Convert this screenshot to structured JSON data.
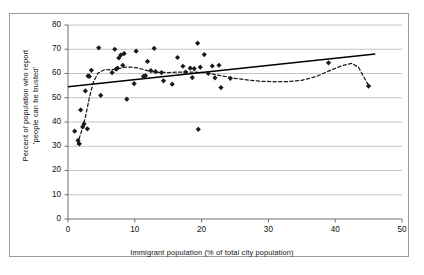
{
  "chart_data": {
    "type": "scatter",
    "title": "",
    "xlabel": "Immigrant population  (% of total city population)",
    "ylabel": "Percent of population who report 'people can be trusted'",
    "ylabel_line1": "Percent of population who report",
    "ylabel_line2": "'people can be trusted'",
    "xlim": [
      0,
      50
    ],
    "ylim": [
      0,
      80
    ],
    "xticks": [
      0,
      10,
      20,
      30,
      40,
      50
    ],
    "yticks": [
      0,
      10,
      20,
      30,
      40,
      50,
      60,
      70,
      80
    ],
    "xtick_labels": [
      "0",
      "10",
      "20",
      "30",
      "40",
      "50"
    ],
    "ytick_labels": [
      "0",
      "10",
      "20",
      "30",
      "40",
      "50",
      "60",
      "70",
      "80"
    ],
    "grid": "horizontal",
    "legend": "none",
    "marker": "diamond",
    "marker_color": "#1a1a1a",
    "points": [
      {
        "x": 1.0,
        "y": 36.2
      },
      {
        "x": 1.5,
        "y": 32.4
      },
      {
        "x": 1.7,
        "y": 31.0
      },
      {
        "x": 1.9,
        "y": 45.0
      },
      {
        "x": 2.2,
        "y": 38.0
      },
      {
        "x": 2.4,
        "y": 39.2
      },
      {
        "x": 2.6,
        "y": 52.8
      },
      {
        "x": 2.9,
        "y": 37.2
      },
      {
        "x": 3.0,
        "y": 59.0
      },
      {
        "x": 3.2,
        "y": 58.8
      },
      {
        "x": 3.5,
        "y": 61.3
      },
      {
        "x": 4.6,
        "y": 70.6
      },
      {
        "x": 4.9,
        "y": 51.0
      },
      {
        "x": 6.6,
        "y": 60.4
      },
      {
        "x": 7.0,
        "y": 70.0
      },
      {
        "x": 7.2,
        "y": 61.8
      },
      {
        "x": 7.4,
        "y": 62.2
      },
      {
        "x": 7.6,
        "y": 66.4
      },
      {
        "x": 7.9,
        "y": 67.6
      },
      {
        "x": 8.2,
        "y": 63.4
      },
      {
        "x": 8.4,
        "y": 68.2
      },
      {
        "x": 8.8,
        "y": 49.4
      },
      {
        "x": 9.9,
        "y": 55.8
      },
      {
        "x": 10.2,
        "y": 69.2
      },
      {
        "x": 11.3,
        "y": 58.8
      },
      {
        "x": 11.6,
        "y": 59.1
      },
      {
        "x": 11.9,
        "y": 65.0
      },
      {
        "x": 12.4,
        "y": 61.2
      },
      {
        "x": 12.9,
        "y": 70.4
      },
      {
        "x": 13.1,
        "y": 60.8
      },
      {
        "x": 14.0,
        "y": 60.4
      },
      {
        "x": 14.3,
        "y": 57.0
      },
      {
        "x": 15.6,
        "y": 55.6
      },
      {
        "x": 16.4,
        "y": 66.6
      },
      {
        "x": 17.2,
        "y": 63.0
      },
      {
        "x": 17.6,
        "y": 60.6
      },
      {
        "x": 18.3,
        "y": 62.2
      },
      {
        "x": 18.6,
        "y": 58.3
      },
      {
        "x": 18.9,
        "y": 62.0
      },
      {
        "x": 19.4,
        "y": 72.5
      },
      {
        "x": 19.5,
        "y": 37.0
      },
      {
        "x": 19.8,
        "y": 62.6
      },
      {
        "x": 20.4,
        "y": 67.8
      },
      {
        "x": 21.0,
        "y": 60.0
      },
      {
        "x": 21.6,
        "y": 63.1
      },
      {
        "x": 22.0,
        "y": 58.2
      },
      {
        "x": 22.6,
        "y": 63.4
      },
      {
        "x": 22.9,
        "y": 54.2
      },
      {
        "x": 24.3,
        "y": 58.0
      },
      {
        "x": 39.0,
        "y": 64.4
      },
      {
        "x": 45.0,
        "y": 54.8
      }
    ],
    "linear_trend": {
      "style": "solid",
      "color": "#000000",
      "x0": 0.0,
      "y0": 54.5,
      "x1": 46.0,
      "y1": 68.0
    },
    "smoothed_trend": {
      "style": "dashed-dotted",
      "color": "#1a1a1a",
      "points": [
        {
          "x": 1.4,
          "y": 30.8
        },
        {
          "x": 2.0,
          "y": 36.0
        },
        {
          "x": 2.6,
          "y": 42.0
        },
        {
          "x": 3.2,
          "y": 50.0
        },
        {
          "x": 3.8,
          "y": 56.5
        },
        {
          "x": 4.5,
          "y": 60.2
        },
        {
          "x": 5.5,
          "y": 61.6
        },
        {
          "x": 6.5,
          "y": 61.5
        },
        {
          "x": 7.5,
          "y": 62.0
        },
        {
          "x": 8.5,
          "y": 62.6
        },
        {
          "x": 9.5,
          "y": 62.6
        },
        {
          "x": 10.5,
          "y": 62.3
        },
        {
          "x": 11.5,
          "y": 61.4
        },
        {
          "x": 12.5,
          "y": 60.8
        },
        {
          "x": 13.5,
          "y": 60.5
        },
        {
          "x": 15.0,
          "y": 60.4
        },
        {
          "x": 17.0,
          "y": 60.6
        },
        {
          "x": 19.0,
          "y": 60.6
        },
        {
          "x": 21.0,
          "y": 60.2
        },
        {
          "x": 23.0,
          "y": 59.0
        },
        {
          "x": 25.0,
          "y": 58.0
        },
        {
          "x": 27.0,
          "y": 57.3
        },
        {
          "x": 29.0,
          "y": 56.8
        },
        {
          "x": 31.0,
          "y": 56.6
        },
        {
          "x": 33.0,
          "y": 56.7
        },
        {
          "x": 35.0,
          "y": 57.2
        },
        {
          "x": 37.0,
          "y": 58.6
        },
        {
          "x": 39.0,
          "y": 61.0
        },
        {
          "x": 41.0,
          "y": 63.2
        },
        {
          "x": 42.5,
          "y": 64.2
        },
        {
          "x": 43.5,
          "y": 62.5
        },
        {
          "x": 44.3,
          "y": 58.5
        },
        {
          "x": 45.0,
          "y": 55.0
        }
      ]
    }
  },
  "top_fragment": "",
  "colors": {
    "grid": "#b6b6b6",
    "axis": "#6e6e6e",
    "frame": "#9a9a9a",
    "text": "#111111",
    "marker": "#1a1a1a"
  }
}
